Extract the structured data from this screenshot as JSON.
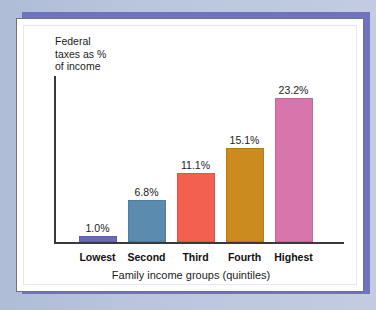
{
  "chart_data": {
    "type": "bar",
    "title": "",
    "ylabel": "Federal\ntaxes as %\nof income",
    "xlabel": "Family income groups (quintiles)",
    "categories": [
      "Lowest",
      "Second",
      "Third",
      "Fourth",
      "Highest"
    ],
    "values": [
      1.0,
      6.8,
      15.1,
      11.1,
      23.2
    ],
    "value_labels": [
      "1.0%",
      "6.8%",
      "11.1%",
      "15.1%",
      "23.2%"
    ],
    "series": [
      {
        "name": "Federal taxes as % of income",
        "values": [
          1.0,
          6.8,
          11.1,
          15.1,
          23.2
        ]
      }
    ],
    "bars": [
      {
        "category": "Lowest",
        "value": 1.0,
        "label": "1.0%",
        "color": "#6a6ab8"
      },
      {
        "category": "Second",
        "value": 6.8,
        "label": "6.8%",
        "color": "#5b8cb0"
      },
      {
        "category": "Third",
        "value": 11.1,
        "label": "11.1%",
        "color": "#f4604f"
      },
      {
        "category": "Fourth",
        "value": 15.1,
        "label": "15.1%",
        "color": "#cc8b1e"
      },
      {
        "category": "Highest",
        "value": 23.2,
        "label": "23.2%",
        "color": "#d875ad"
      }
    ],
    "ylim": [
      0,
      24.5
    ],
    "grid": false,
    "legend": "none",
    "axis_color": "#3a3a3a"
  },
  "frame": {
    "page_background": "#b9c4dc",
    "accent_band": "#6f73bd",
    "card_background": "#ffffff",
    "card_border": "#6f7380"
  }
}
